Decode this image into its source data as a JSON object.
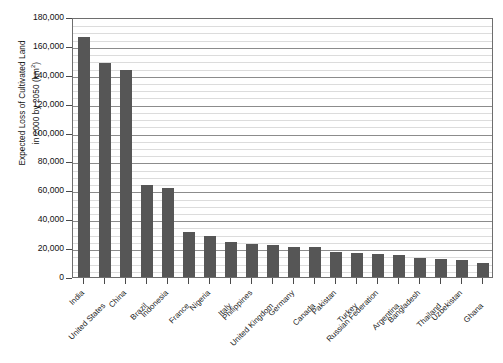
{
  "chart_data": {
    "type": "bar",
    "title": "",
    "xlabel": "",
    "ylabel_line1": "Expected Loss of Cultivated Land",
    "ylabel_line2": "in 2000 by 2050 (km",
    "ylabel_unit_sup": "2",
    "ylabel_line2_end": ")",
    "ylim": [
      0,
      180000
    ],
    "ytick_step": 20000,
    "yminor_step": 5000,
    "grid": true,
    "legend": "none",
    "bar_color": "#565656",
    "axis_color": "#6e6e6e",
    "categories": [
      "India",
      "United States",
      "China",
      "Brazil",
      "Indonesia",
      "France",
      "Nigeria",
      "Italy",
      "Philippines",
      "United Kingdom",
      "Germany",
      "Canada",
      "Pakistan",
      "Turkey",
      "Russian Federation",
      "Argentina",
      "Bangladesh",
      "Thailand",
      "Uzbekistan",
      "Ghana"
    ],
    "values": [
      166000,
      148000,
      143000,
      63500,
      61500,
      31000,
      28500,
      24000,
      23000,
      22500,
      21000,
      20500,
      17500,
      16500,
      16000,
      15500,
      13500,
      12500,
      11500,
      10000
    ],
    "ytick_labels": [
      "0",
      "20,000",
      "40,000",
      "60,000",
      "80,000",
      "100,000",
      "120,000",
      "140,000",
      "160,000",
      "180,000"
    ]
  }
}
